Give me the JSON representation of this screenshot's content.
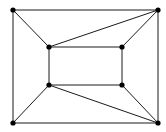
{
  "diagram": {
    "type": "graph",
    "nodes": [
      {
        "id": "outer-top-left"
      },
      {
        "id": "outer-top-right"
      },
      {
        "id": "outer-bottom-left"
      },
      {
        "id": "outer-bottom-right"
      },
      {
        "id": "inner-top-left"
      },
      {
        "id": "inner-top-right"
      },
      {
        "id": "inner-bottom-left"
      },
      {
        "id": "inner-bottom-right"
      }
    ],
    "edges": [
      [
        "outer-top-left",
        "outer-top-right"
      ],
      [
        "outer-top-right",
        "outer-bottom-right"
      ],
      [
        "outer-bottom-right",
        "outer-bottom-left"
      ],
      [
        "outer-bottom-left",
        "outer-top-left"
      ],
      [
        "inner-top-left",
        "inner-top-right"
      ],
      [
        "inner-top-right",
        "inner-bottom-right"
      ],
      [
        "inner-bottom-right",
        "inner-bottom-left"
      ],
      [
        "inner-bottom-left",
        "inner-top-left"
      ],
      [
        "outer-top-left",
        "inner-top-left"
      ],
      [
        "outer-top-right",
        "inner-top-right"
      ],
      [
        "outer-top-right",
        "inner-top-left"
      ],
      [
        "outer-bottom-left",
        "inner-bottom-left"
      ],
      [
        "outer-bottom-right",
        "inner-bottom-right"
      ],
      [
        "outer-bottom-right",
        "inner-bottom-left"
      ]
    ],
    "colors": {
      "edge": "#1a1a1a",
      "node": "#000000",
      "background": "#ffffff"
    }
  }
}
